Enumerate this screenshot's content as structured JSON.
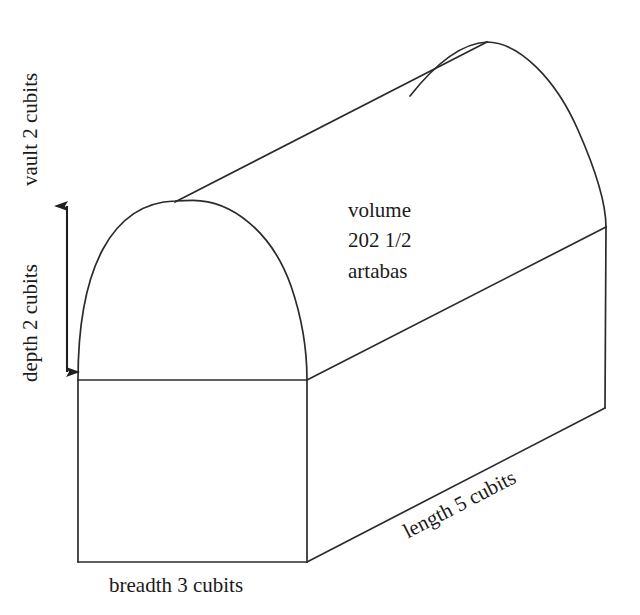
{
  "figure": {
    "stroke_color": "#2b2b2b",
    "background_color": "#ffffff",
    "text_color": "#1a1a1a"
  },
  "labels": {
    "vault": "vault 2 cubits",
    "depth": "depth 2 cubits",
    "breadth": "breadth 3 cubits",
    "length": "length 5 cubits",
    "volume_line1": "volume",
    "volume_line2": "202 1/2",
    "volume_line3": "artabas"
  },
  "measurements": {
    "vault_height": "2",
    "depth": "2",
    "breadth": "3",
    "length": "5",
    "unit": "cubits",
    "volume_value": "202 1/2",
    "volume_unit": "artabas"
  },
  "geometry": {
    "front_left_x": 78,
    "front_right_x": 307,
    "springing_y": 380,
    "base_y": 562,
    "front_apex": [
      193,
      200
    ],
    "rear_apex": [
      487,
      42
    ],
    "rear_right_spring": [
      606,
      227
    ],
    "rear_right_base": [
      605,
      408
    ],
    "tangent_start": [
      175,
      202
    ],
    "arrow_x": 67,
    "arrow_top_y": 203,
    "arrow_bottom_y": 375
  }
}
